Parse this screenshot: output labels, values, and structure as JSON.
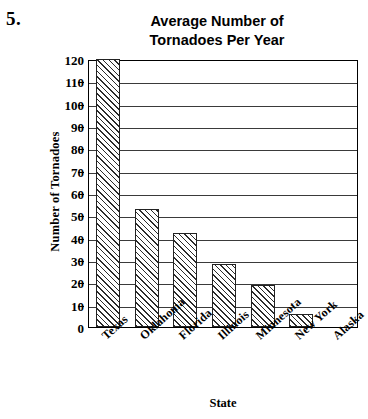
{
  "problem_number": "5.",
  "chart_data": {
    "type": "bar",
    "title": "Average Number of Tornadoes Per Year",
    "title_lines": [
      "Average Number of",
      "Tornadoes Per Year"
    ],
    "xlabel": "State",
    "ylabel": "Number of Tornadoes",
    "categories": [
      "Texas",
      "Oklahoma",
      "Florida",
      "Illinois",
      "Minnesota",
      "New York",
      "Alaska"
    ],
    "values": [
      120,
      53,
      42,
      28,
      19,
      6,
      0
    ],
    "ylim": [
      0,
      120
    ],
    "ytick_step": 10,
    "yticks": [
      120,
      110,
      100,
      90,
      80,
      70,
      60,
      50,
      40,
      30,
      20,
      10,
      0
    ],
    "grid": "horizontal",
    "legend": "none",
    "bar_fill": "diagonal-hatch",
    "bar_edge_color": "#222222",
    "background_color": "#ffffff"
  }
}
